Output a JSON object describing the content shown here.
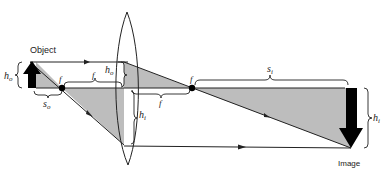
{
  "diagram": {
    "type": "thin-lens-ray-diagram",
    "labels": {
      "object": "Object",
      "image": "Image",
      "focal_left": "f",
      "focal_right": "f",
      "f_upper": "f",
      "f_lower": "f",
      "h_o_left": "h",
      "h_o_left_sub": "o",
      "h_o_lens": "h",
      "h_o_lens_sub": "o",
      "h_i_lens": "h",
      "h_i_lens_sub": "i",
      "h_i_right": "h",
      "h_i_right_sub": "i",
      "s_o": "s",
      "s_o_sub": "o",
      "s_i": "s",
      "s_i_sub": "i"
    },
    "colors": {
      "shade": "#bdbdbd",
      "line": "#222222",
      "arrow": "#000000"
    }
  }
}
